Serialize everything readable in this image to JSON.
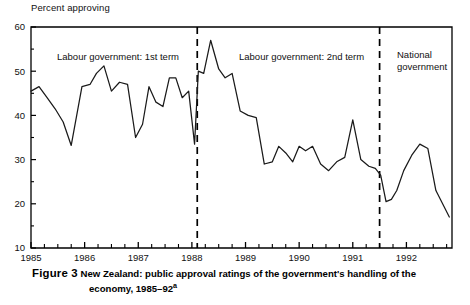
{
  "figure": {
    "number_label": "Figure 3",
    "caption_line1": "New Zealand: public approval ratings of the government's handling of the",
    "caption_line2": "economy, 1985–92",
    "caption_footnote_marker": "a"
  },
  "axes": {
    "y_axis_title": "Percent approving",
    "y_ticks": [
      "60",
      "50",
      "40",
      "30",
      "20",
      "10"
    ],
    "y_tick_values": [
      60,
      50,
      40,
      30,
      20,
      10
    ],
    "y_minor_step": 5,
    "x_ticks": [
      "1985",
      "1986",
      "1987",
      "1988",
      "1989",
      "1990",
      "1991",
      "1992"
    ],
    "x_tick_values": [
      1985,
      1986,
      1987,
      1988,
      1989,
      1990,
      1991,
      1992
    ],
    "x_minor_per_year": 4
  },
  "annotations": [
    {
      "name": "labour-1st-term",
      "text": "Labour government: 1st term",
      "x_px": 57,
      "y_px": 60
    },
    {
      "name": "labour-2nd-term",
      "text": "Labour government: 2nd term",
      "x_px": 239,
      "y_px": 60
    },
    {
      "name": "national-government-line1",
      "text": "National",
      "x_px": 397,
      "y_px": 58
    },
    {
      "name": "national-government-line2",
      "text": "government",
      "x_px": 397,
      "y_px": 70
    }
  ],
  "markers": [
    {
      "name": "divider-1988",
      "x_value": 1988.1,
      "style": "dashed"
    },
    {
      "name": "divider-1991-oct",
      "x_value": 1991.5,
      "style": "dashed"
    }
  ],
  "colors": {
    "line": "#1a1a1a",
    "axis": "#000000",
    "background": "#ffffff",
    "text": "#111111"
  },
  "chart_data": {
    "type": "line",
    "title": "New Zealand: public approval ratings of the government's handling of the economy, 1985–92",
    "xlabel": "",
    "ylabel": "Percent approving",
    "xlim": [
      1985.0,
      1992.85
    ],
    "ylim": [
      10,
      60
    ],
    "grid": false,
    "legend": null,
    "series": [
      {
        "name": "Percent approving",
        "x": [
          1985.0,
          1985.15,
          1985.3,
          1985.45,
          1985.6,
          1985.75,
          1985.95,
          1986.1,
          1986.22,
          1986.36,
          1986.5,
          1986.65,
          1986.8,
          1986.95,
          1987.08,
          1987.2,
          1987.33,
          1987.46,
          1987.58,
          1987.7,
          1987.82,
          1987.94,
          1988.05,
          1988.12,
          1988.22,
          1988.35,
          1988.5,
          1988.62,
          1988.75,
          1988.9,
          1989.05,
          1989.2,
          1989.35,
          1989.5,
          1989.62,
          1989.75,
          1989.88,
          1990.0,
          1990.12,
          1990.25,
          1990.4,
          1990.55,
          1990.7,
          1990.85,
          1991.0,
          1991.15,
          1991.3,
          1991.42,
          1991.52,
          1991.62,
          1991.72,
          1991.82,
          1991.95,
          1992.1,
          1992.25,
          1992.4,
          1992.55,
          1992.8
        ],
        "values": [
          45.5,
          46.5,
          44.0,
          41.5,
          38.5,
          33.2,
          46.5,
          47.0,
          49.5,
          51.2,
          45.5,
          47.5,
          47.0,
          35.0,
          38.0,
          46.5,
          43.0,
          42.0,
          48.5,
          48.5,
          44.0,
          45.5,
          33.5,
          50.0,
          49.5,
          57.0,
          50.5,
          48.5,
          49.5,
          41.0,
          40.0,
          39.5,
          29.0,
          29.5,
          33.0,
          31.5,
          29.5,
          33.0,
          32.0,
          33.0,
          29.0,
          27.5,
          29.5,
          30.5,
          39.0,
          30.0,
          28.5,
          28.0,
          26.5,
          20.5,
          21.0,
          23.0,
          27.5,
          31.0,
          33.5,
          32.5,
          23.0,
          17.0
        ]
      }
    ],
    "annotations": [
      "Labour government: 1st term",
      "Labour government: 2nd term",
      "National government"
    ],
    "vertical_markers": [
      1988.1,
      1991.5
    ]
  }
}
